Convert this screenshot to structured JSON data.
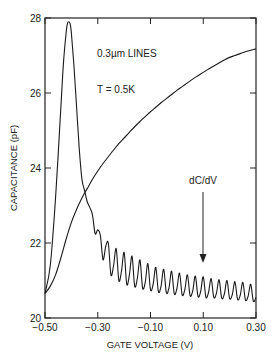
{
  "chart_data": {
    "type": "line",
    "title": "",
    "xlabel": "GATE VOLTAGE (V)",
    "ylabel": "CAPACITANCE (pF)",
    "xlim": [
      -0.5,
      0.3
    ],
    "ylim": [
      20,
      28
    ],
    "x_ticks": [
      -0.5,
      -0.3,
      -0.1,
      0.1,
      0.3
    ],
    "x_tick_labels": [
      "-0.50",
      "-0.30",
      "-0.10",
      "0.10",
      "0.30"
    ],
    "y_ticks": [
      20,
      22,
      24,
      26,
      28
    ],
    "y_tick_labels": [
      "20",
      "22",
      "24",
      "26",
      "28"
    ],
    "grid": false,
    "legend": null,
    "annotations": [
      {
        "text": "0.3µm LINES",
        "x": -0.32,
        "y": 27.4
      },
      {
        "text": "T = 0.5K",
        "x": -0.32,
        "y": 26.1
      },
      {
        "text": "dC/dV",
        "x": 0.1,
        "y": 22.9,
        "arrow_to": [
          0.1,
          21.5
        ]
      }
    ],
    "series": [
      {
        "name": "C",
        "x": [
          -0.5,
          -0.48,
          -0.46,
          -0.44,
          -0.42,
          -0.4,
          -0.38,
          -0.36,
          -0.34,
          -0.32,
          -0.3,
          -0.28,
          -0.26,
          -0.24,
          -0.22,
          -0.2,
          -0.18,
          -0.16,
          -0.14,
          -0.12,
          -0.1,
          -0.08,
          -0.06,
          -0.04,
          -0.02,
          0.0,
          0.02,
          0.04,
          0.06,
          0.08,
          0.1,
          0.12,
          0.14,
          0.16,
          0.18,
          0.2,
          0.22,
          0.24,
          0.26,
          0.28,
          0.3
        ],
        "values": [
          20.65,
          20.85,
          21.15,
          21.6,
          22.1,
          22.55,
          22.9,
          23.2,
          23.45,
          23.7,
          23.92,
          24.12,
          24.3,
          24.48,
          24.65,
          24.8,
          24.95,
          25.1,
          25.24,
          25.37,
          25.5,
          25.62,
          25.74,
          25.85,
          25.96,
          26.07,
          26.17,
          26.27,
          26.37,
          26.46,
          26.55,
          26.64,
          26.72,
          26.8,
          26.88,
          26.95,
          27.0,
          27.05,
          27.1,
          27.14,
          27.18
        ]
      },
      {
        "name": "dC/dV",
        "x": [
          -0.5,
          -0.48,
          -0.46,
          -0.44,
          -0.43,
          -0.42,
          -0.415,
          -0.41,
          -0.405,
          -0.4,
          -0.39,
          -0.38,
          -0.37,
          -0.36,
          -0.35,
          -0.34,
          -0.33,
          -0.32,
          -0.31,
          -0.3,
          -0.29,
          -0.28,
          -0.27,
          -0.26,
          -0.25,
          -0.24,
          -0.23,
          -0.22,
          -0.21,
          -0.2,
          -0.19,
          -0.18,
          -0.17,
          -0.16,
          -0.15,
          -0.14,
          -0.13,
          -0.12,
          -0.11,
          -0.1,
          -0.09,
          -0.08,
          -0.07,
          -0.06,
          -0.05,
          -0.04,
          -0.03,
          -0.02,
          -0.01,
          0.0,
          0.01,
          0.02,
          0.03,
          0.04,
          0.05,
          0.06,
          0.07,
          0.08,
          0.09,
          0.1,
          0.11,
          0.12,
          0.13,
          0.14,
          0.15,
          0.16,
          0.17,
          0.18,
          0.19,
          0.2,
          0.21,
          0.22,
          0.23,
          0.24,
          0.25,
          0.26,
          0.27,
          0.28,
          0.29,
          0.3
        ],
        "values": [
          20.65,
          21.4,
          23.2,
          25.6,
          26.8,
          27.6,
          27.85,
          27.9,
          27.85,
          27.6,
          26.7,
          25.6,
          24.5,
          23.7,
          23.4,
          23.1,
          22.95,
          22.75,
          22.25,
          22.35,
          22.2,
          21.55,
          21.9,
          22.0,
          21.15,
          21.4,
          21.85,
          21.0,
          21.25,
          21.75,
          20.9,
          21.15,
          21.65,
          20.85,
          21.05,
          21.55,
          20.8,
          20.95,
          21.45,
          20.75,
          20.9,
          21.35,
          20.7,
          20.85,
          21.3,
          20.68,
          20.8,
          21.25,
          20.65,
          20.78,
          21.2,
          20.62,
          20.75,
          21.15,
          20.6,
          20.72,
          21.12,
          20.58,
          20.7,
          21.1,
          20.56,
          20.68,
          21.05,
          20.55,
          20.66,
          21.02,
          20.53,
          20.64,
          21.0,
          20.52,
          20.62,
          20.97,
          20.5,
          20.6,
          20.95,
          20.48,
          20.58,
          20.9,
          20.45,
          20.55
        ]
      }
    ]
  },
  "labels": {
    "xlabel": "GATE VOLTAGE (V)",
    "ylabel": "CAPACITANCE (pF)",
    "annot_lines": "0.3µm LINES",
    "annot_temp": "T = 0.5K",
    "annot_dcdv": "dC/dV"
  }
}
